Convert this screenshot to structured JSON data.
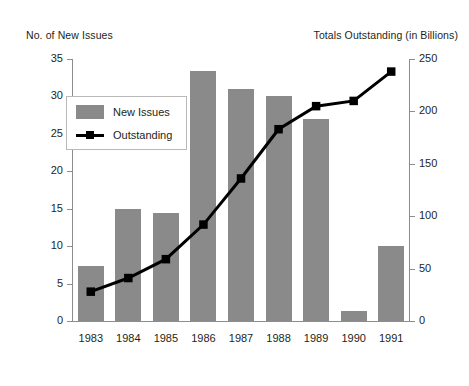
{
  "chart_data": {
    "type": "bar",
    "title": "",
    "subtitle": "",
    "xlabel": "",
    "ylabel": "No. of New Issues",
    "y2label": "Totals Outstanding (in Billions)",
    "categories": [
      "1983",
      "1984",
      "1985",
      "1986",
      "1987",
      "1988",
      "1989",
      "1990",
      "1991"
    ],
    "grid": false,
    "legend_position": "upper-left-inside",
    "axes": {
      "left": {
        "label": "No. of New Issues",
        "min": 0,
        "max": 35,
        "tick_step": 5,
        "ticks": [
          "0",
          "5",
          "10",
          "15",
          "20",
          "25",
          "30",
          "35"
        ]
      },
      "right": {
        "label": "Totals Outstanding (in Billions)",
        "min": 0,
        "max": 250,
        "tick_step": 50,
        "ticks": [
          "0",
          "50",
          "100",
          "150",
          "200",
          "250"
        ]
      }
    },
    "series": [
      {
        "name": "New Issues",
        "type": "bar",
        "axis": "left",
        "color": "#8a8a8a",
        "values": [
          7.3,
          15.0,
          14.4,
          33.4,
          31.0,
          30.0,
          27.0,
          1.3,
          10.0
        ]
      },
      {
        "name": "Outstanding",
        "type": "line",
        "axis": "right",
        "color": "#000000",
        "marker": "square",
        "values": [
          28,
          41,
          59,
          92,
          136,
          183,
          205,
          210,
          238
        ]
      }
    ]
  },
  "legend": {
    "items": [
      {
        "label": "New Issues",
        "marker": "bar-swatch"
      },
      {
        "label": "Outstanding",
        "marker": "line-square"
      }
    ]
  }
}
